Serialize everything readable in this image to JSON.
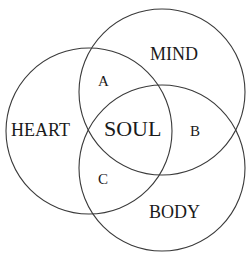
{
  "diagram": {
    "type": "venn",
    "sets": [
      {
        "id": "heart",
        "label": "HEART"
      },
      {
        "id": "mind",
        "label": "MIND"
      },
      {
        "id": "body",
        "label": "BODY"
      }
    ],
    "regions": {
      "center": "SOUL",
      "heart_mind": "A",
      "mind_body": "B",
      "heart_body": "C"
    },
    "colors": {
      "stroke": "#3a3a3a",
      "text": "#1a1a1a",
      "background": "#ffffff"
    }
  }
}
